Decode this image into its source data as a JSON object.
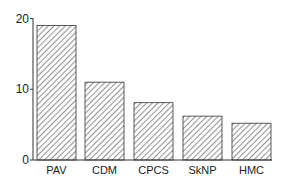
{
  "chart_data": {
    "type": "bar",
    "title": "",
    "xlabel": "",
    "ylabel": "",
    "categories": [
      "PAV",
      "CDM",
      "CPCS",
      "SkNP",
      "HMC"
    ],
    "values": [
      19,
      11,
      8.1,
      6.2,
      5.2
    ],
    "ylim": [
      0,
      20
    ],
    "yticks": [
      0,
      10,
      20
    ],
    "grid": false,
    "legend": null,
    "bar_fill": "diagonal-hatch",
    "colors": {
      "stroke": "#333333",
      "hatch": "#555555",
      "background": "#ffffff"
    }
  },
  "axis": {
    "ytick_labels": [
      "0",
      "10",
      "20"
    ]
  }
}
